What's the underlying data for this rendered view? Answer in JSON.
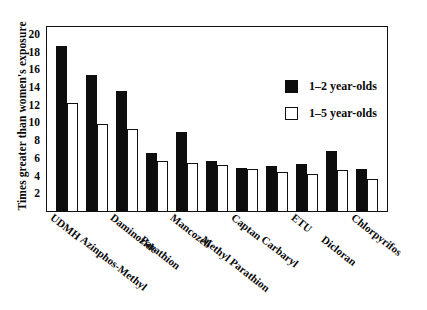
{
  "chart_data": {
    "type": "bar",
    "title": "",
    "xlabel": "",
    "ylabel": "Times greater than women's exposure",
    "ylim": [
      0,
      21
    ],
    "yticks": [
      2,
      4,
      6,
      8,
      10,
      12,
      14,
      16,
      18,
      20
    ],
    "grid": false,
    "legend_position": "upper-right-inside",
    "categories": [
      "UDMH",
      "Azinphos-Methyl",
      "Daminozide",
      "Parathion",
      "Mancozeb",
      "Methyl Parathion",
      "Captan",
      "Carbaryl",
      "ETU",
      "Dicloran",
      "Chlorpyrifos"
    ],
    "series": [
      {
        "name": "1–2 year-olds",
        "color": "#0d0d0d",
        "style": "filled",
        "values": [
          18.6,
          15.4,
          13.6,
          6.6,
          8.9,
          5.6,
          4.9,
          5.1,
          5.3,
          6.8,
          4.7
        ]
      },
      {
        "name": "1–5 year-olds",
        "color": "#ffffff",
        "style": "outlined",
        "values": [
          12.2,
          9.8,
          9.3,
          5.6,
          5.4,
          5.2,
          4.7,
          4.4,
          4.2,
          4.6,
          3.6
        ]
      }
    ]
  },
  "legend": {
    "entries": [
      {
        "label": "1–2 year-olds",
        "swatch": "filled-square-black"
      },
      {
        "label": "1–5 year-olds",
        "swatch": "open-square-white"
      }
    ]
  },
  "axes": {
    "y_title": "Times greater than women's exposure",
    "y_tick_labels": [
      "20",
      "18",
      "16",
      "14",
      "12",
      "10",
      "8",
      "6",
      "4",
      "2"
    ]
  }
}
